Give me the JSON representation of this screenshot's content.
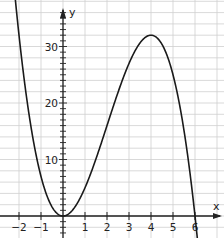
{
  "chart_data": {
    "type": "line",
    "title": "",
    "xlabel": "x",
    "ylabel": "y",
    "function": "f(x) = -x^3 + 6x^2",
    "xlim": [
      -2.85,
      7.3
    ],
    "ylim": [
      -3.9,
      38
    ],
    "grid": true,
    "x_ticks": [
      -2,
      -1,
      1,
      2,
      3,
      4,
      5,
      6
    ],
    "y_ticks": [
      10,
      20,
      30
    ],
    "x_tick_labels": [
      "-2",
      "-1",
      "1",
      "2",
      "3",
      "4",
      "5",
      "6"
    ],
    "y_tick_labels": [
      "10",
      "20",
      "30"
    ],
    "series": [
      {
        "name": "f(x)",
        "x": [
          -2.2,
          -2,
          -1.5,
          -1,
          -0.5,
          0,
          0.5,
          1,
          1.5,
          2,
          2.5,
          3,
          3.5,
          4,
          4.5,
          5,
          5.5,
          6,
          6.1
        ],
        "values": [
          39.6,
          32,
          16.9,
          7,
          1.63,
          0,
          1.38,
          5,
          10.1,
          16,
          21.9,
          27,
          31.6,
          32,
          30.4,
          25,
          15.1,
          0,
          -4.2
        ]
      }
    ],
    "key_points": {
      "local_min": [
        0,
        0
      ],
      "local_max": [
        4,
        32
      ],
      "roots": [
        0,
        6
      ]
    }
  },
  "colors": {
    "grid": "#cfcfcf",
    "axis": "#222222",
    "curve": "#1a1a1a"
  }
}
